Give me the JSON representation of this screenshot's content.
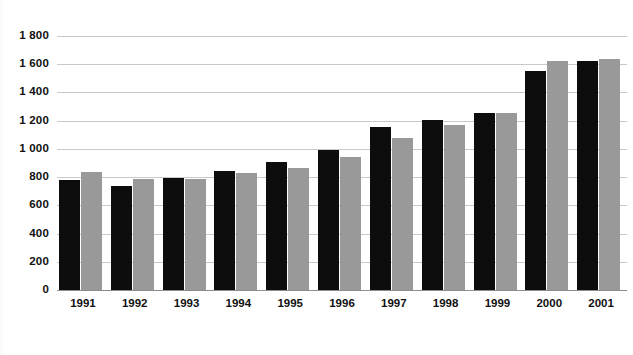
{
  "chart_data": {
    "type": "bar",
    "title": "",
    "subtitle": "",
    "xlabel": "",
    "ylabel": "",
    "categories": [
      "1991",
      "1992",
      "1993",
      "1994",
      "1995",
      "1996",
      "1997",
      "1998",
      "1999",
      "2000",
      "2001"
    ],
    "series": [
      {
        "name": "Series 1",
        "color": "#0d0d0d",
        "values": [
          780,
          740,
          795,
          845,
          905,
          990,
          1155,
          1205,
          1255,
          1550,
          1620
        ]
      },
      {
        "name": "Series 2",
        "color": "#999999",
        "values": [
          840,
          785,
          790,
          828,
          865,
          945,
          1080,
          1170,
          1255,
          1620,
          1640
        ]
      }
    ],
    "ylim": [
      0,
      1800
    ],
    "ytick_values": [
      0,
      200,
      400,
      600,
      800,
      1000,
      1200,
      1400,
      1600,
      1800
    ],
    "ytick_labels": [
      "0",
      "200",
      "400",
      "600",
      "800",
      "1 000",
      "1 200",
      "1 400",
      "1 600",
      "1 800"
    ],
    "grid": true,
    "grid_axis": "y",
    "legend": false,
    "legend_position": "none",
    "annotations": []
  },
  "style": {
    "background": "#ffffff",
    "grid_color": "#c9c9c9",
    "axis_color": "#8d8d8d",
    "text_color": "#111111"
  }
}
